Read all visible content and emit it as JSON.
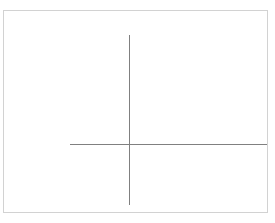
{
  "canvas": {
    "width": 275,
    "height": 223,
    "background_color": "#ffffff"
  },
  "panel": {
    "name": "plot-panel",
    "border_color": "#d2d2d2",
    "border_width": 1,
    "background_color": "#ffffff",
    "left": 3,
    "top": 10,
    "width": 265,
    "height": 203
  },
  "crosshair": {
    "color": "#808080",
    "line_width": 1,
    "intersection": {
      "x": 129,
      "y": 144
    },
    "vertical": {
      "x": 129,
      "y_start": 35,
      "y_end": 205,
      "length": 170
    },
    "horizontal": {
      "y": 144,
      "x_start": 70,
      "x_end": 267,
      "length": 197
    }
  },
  "content": {
    "has_text": false,
    "has_axis_labels": false,
    "has_tick_marks": false,
    "has_legend": false
  }
}
